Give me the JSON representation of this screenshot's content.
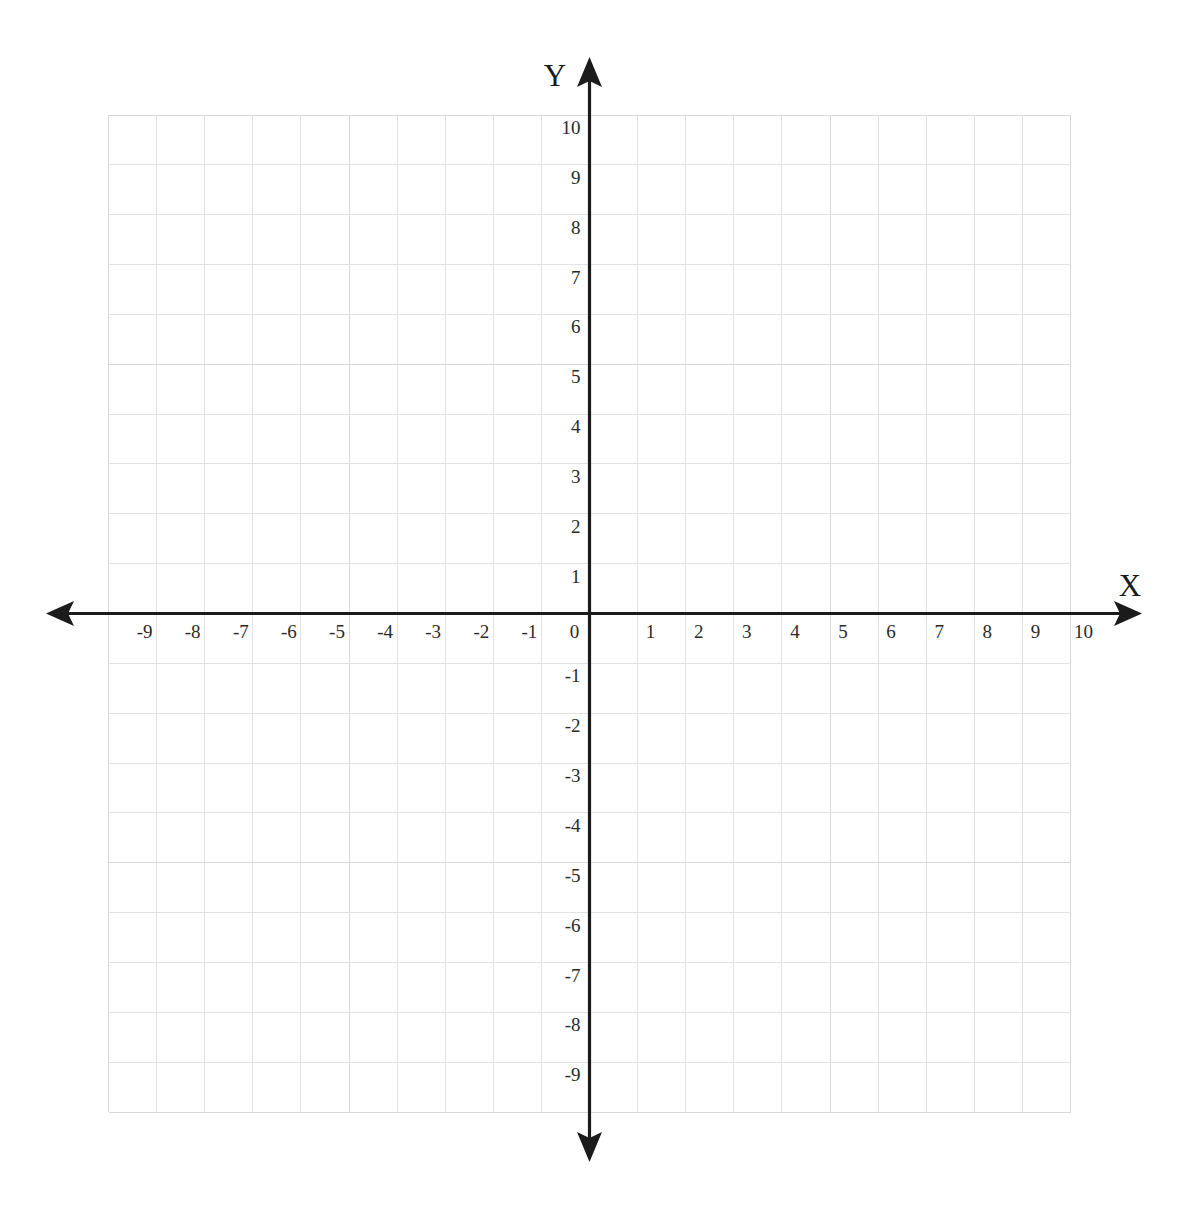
{
  "chart_data": {
    "type": "scatter",
    "title": "",
    "subtitle": "",
    "xlabel": "X",
    "ylabel": "Y",
    "xlim": [
      -10,
      10
    ],
    "ylim": [
      -10,
      10
    ],
    "grid": true,
    "legend": null,
    "series": [],
    "x_tick_labels": [
      "-9",
      "-8",
      "-7",
      "-6",
      "-5",
      "-4",
      "-3",
      "-2",
      "-1",
      "0",
      "1",
      "2",
      "3",
      "4",
      "5",
      "6",
      "7",
      "8",
      "9",
      "10"
    ],
    "x_tick_values": [
      -9,
      -8,
      -7,
      -6,
      -5,
      -4,
      -3,
      -2,
      -1,
      0,
      1,
      2,
      3,
      4,
      5,
      6,
      7,
      8,
      9,
      10
    ],
    "y_tick_labels": [
      "10",
      "9",
      "8",
      "7",
      "6",
      "5",
      "4",
      "3",
      "2",
      "1",
      "-1",
      "-2",
      "-3",
      "-4",
      "-5",
      "-6",
      "-7",
      "-8",
      "-9"
    ],
    "y_tick_values": [
      10,
      9,
      8,
      7,
      6,
      5,
      4,
      3,
      2,
      1,
      -1,
      -2,
      -3,
      -4,
      -5,
      -6,
      -7,
      -8,
      -9
    ],
    "origin_label": "0",
    "grid_x_range": [
      -10,
      10
    ],
    "grid_y_range": [
      -10,
      10
    ],
    "axis_color": "#1b1b1b",
    "grid_color": "#d8d8da",
    "background_color": "#ffffff",
    "annotations": []
  },
  "axes": {
    "x_axis_name": "X",
    "y_axis_name": "Y",
    "x_arrow_left": "arrow-left-icon",
    "x_arrow_right": "arrow-right-icon",
    "y_arrow_up": "arrow-up-icon",
    "y_arrow_down": "arrow-down-icon"
  }
}
